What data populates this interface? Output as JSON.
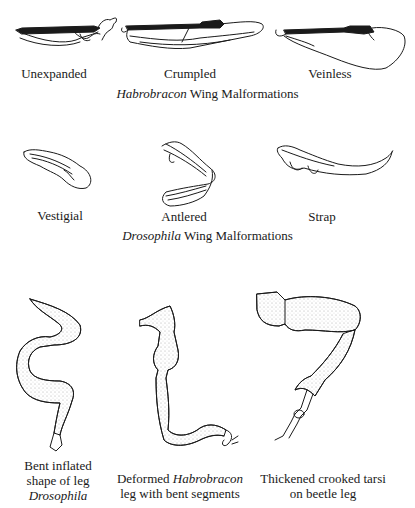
{
  "habrobracon_section": {
    "wings": [
      {
        "label": "Unexpanded"
      },
      {
        "label": "Crumpled"
      },
      {
        "label": "Veinless"
      }
    ],
    "caption_italic": "Habrobracon",
    "caption_rest": " Wing Malformations"
  },
  "drosophila_section": {
    "wings": [
      {
        "label": "Vestigial"
      },
      {
        "label": "Antlered"
      },
      {
        "label": "Strap"
      }
    ],
    "caption_italic": "Drosophila",
    "caption_rest": " Wing Malformations"
  },
  "legs_section": {
    "legs": [
      {
        "line1": "Bent inflated",
        "line2": "shape of leg",
        "line3_italic": "Drosophila"
      },
      {
        "line1_pre": "Deformed ",
        "line1_italic": "Habrobracon",
        "line2": "leg with bent segments"
      },
      {
        "line1": "Thickened crooked tarsi",
        "line2": "on beetle leg"
      }
    ]
  }
}
